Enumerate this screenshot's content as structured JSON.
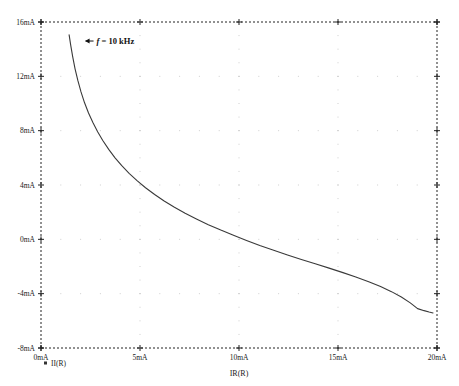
{
  "chart_data": {
    "type": "line",
    "title": "",
    "xlabel": "IR(R)",
    "ylabel": "",
    "xlim": [
      0,
      20
    ],
    "ylim": [
      -8,
      16
    ],
    "xunit": "mA",
    "yunit": "mA",
    "grid": true,
    "grid_style": "dotted-minor",
    "border_style": "dashed",
    "legend": {
      "position": "bottom-left",
      "entries": [
        {
          "label": "II(R)",
          "marker": "square",
          "color": "#333333"
        }
      ]
    },
    "xticks": [
      {
        "value": 0,
        "label": "0mA"
      },
      {
        "value": 5,
        "label": "5mA"
      },
      {
        "value": 10,
        "label": "10mA"
      },
      {
        "value": 15,
        "label": "15mA"
      },
      {
        "value": 20,
        "label": "20mA"
      }
    ],
    "yticks": [
      {
        "value": 16,
        "label": "16mA"
      },
      {
        "value": 12,
        "label": "12mA"
      },
      {
        "value": 8,
        "label": "8mA"
      },
      {
        "value": 4,
        "label": "4mA"
      },
      {
        "value": 0,
        "label": "0mA"
      },
      {
        "value": -4,
        "label": "-4mA"
      },
      {
        "value": -8,
        "label": "-8mA"
      }
    ],
    "annotations": [
      {
        "text_prefix": "f",
        "text_suffix": " = 10 kHz",
        "arrow": "left",
        "x": 2.2,
        "y": 14.6
      }
    ],
    "series": [
      {
        "name": "II(R)",
        "color": "#3a3a3a",
        "points": [
          [
            1.42,
            15.05
          ],
          [
            1.5,
            14.3
          ],
          [
            1.6,
            13.45
          ],
          [
            1.72,
            12.55
          ],
          [
            1.86,
            11.7
          ],
          [
            2.02,
            10.85
          ],
          [
            2.2,
            10.05
          ],
          [
            2.4,
            9.3
          ],
          [
            2.62,
            8.6
          ],
          [
            2.86,
            7.92
          ],
          [
            3.12,
            7.28
          ],
          [
            3.42,
            6.62
          ],
          [
            3.74,
            6.0
          ],
          [
            4.08,
            5.42
          ],
          [
            4.45,
            4.86
          ],
          [
            4.85,
            4.32
          ],
          [
            5.28,
            3.8
          ],
          [
            5.74,
            3.3
          ],
          [
            6.22,
            2.82
          ],
          [
            6.74,
            2.36
          ],
          [
            7.28,
            1.92
          ],
          [
            7.85,
            1.5
          ],
          [
            8.45,
            1.08
          ],
          [
            9.08,
            0.68
          ],
          [
            9.72,
            0.3
          ],
          [
            10.38,
            -0.08
          ],
          [
            11.05,
            -0.45
          ],
          [
            11.75,
            -0.8
          ],
          [
            12.45,
            -1.15
          ],
          [
            13.15,
            -1.48
          ],
          [
            13.85,
            -1.8
          ],
          [
            14.55,
            -2.12
          ],
          [
            15.25,
            -2.45
          ],
          [
            15.9,
            -2.78
          ],
          [
            16.55,
            -3.12
          ],
          [
            17.15,
            -3.48
          ],
          [
            17.7,
            -3.85
          ],
          [
            18.2,
            -4.25
          ],
          [
            18.65,
            -4.68
          ],
          [
            19.02,
            -5.1
          ],
          [
            19.35,
            -5.25
          ],
          [
            19.6,
            -5.35
          ],
          [
            19.8,
            -5.42
          ]
        ]
      }
    ]
  }
}
